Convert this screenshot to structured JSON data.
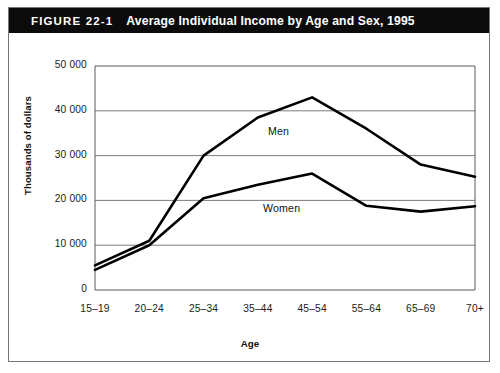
{
  "figure": {
    "number_label": "FIGURE 22-1",
    "title": "Average Individual Income by Age and Sex, 1995",
    "banner_bg": "#0b0b0b",
    "banner_fg": "#ffffff"
  },
  "chart_data": {
    "type": "line",
    "title": "Average Individual Income by Age and Sex, 1995",
    "xlabel": "Age",
    "ylabel": "Thousands of dollars",
    "categories": [
      "15–19",
      "20–24",
      "25–34",
      "35–44",
      "45–54",
      "55–64",
      "65–69",
      "70+"
    ],
    "ylim": [
      0,
      50000
    ],
    "ytick_values": [
      0,
      10000,
      20000,
      30000,
      40000,
      50000
    ],
    "ytick_labels": [
      "0",
      "10 000",
      "20 000",
      "30 000",
      "40 000",
      "50 000"
    ],
    "grid": "horizontal",
    "legend_position": "inline-annotation",
    "series": [
      {
        "name": "Men",
        "color": "#000000",
        "values": [
          5500,
          11000,
          30000,
          38500,
          43000,
          36000,
          28000,
          25300
        ]
      },
      {
        "name": "Women",
        "color": "#000000",
        "values": [
          4500,
          10000,
          20500,
          23500,
          26000,
          18800,
          17500,
          18700
        ]
      }
    ],
    "annotations": [
      {
        "text": "Men",
        "series": "Men",
        "x_px": 268,
        "y_px": 125
      },
      {
        "text": "Women",
        "series": "Women",
        "x_px": 263,
        "y_px": 202
      }
    ]
  },
  "axes_geometry": {
    "plot_left": 95,
    "plot_right": 475,
    "plot_top": 66,
    "plot_bottom": 290
  }
}
